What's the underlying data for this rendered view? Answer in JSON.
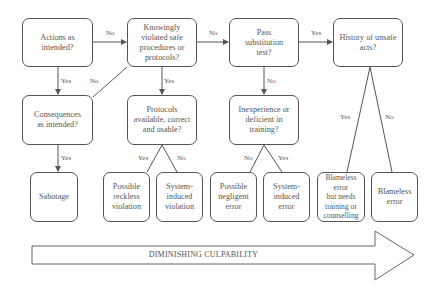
{
  "diagram": {
    "nodes": {
      "actions": "Actions as\nintended?",
      "knowingly": "Knowingly\nviolated safe\nprocedures or\nprotocols?",
      "substitution": "Pass\nsubstitution\ntest?",
      "history": "History of unsafe\nacts?",
      "consequences": "Consequences\nas intended?",
      "protocols": "Protocols\navailable, correct\nand usable?",
      "inexperience": "Inexperience or\ndeficient in\ntraining?",
      "sabotage": "Sabotage",
      "reckless": "Possible\nreckless\nviolation",
      "system_violation": "System-\ninduced\nviolation",
      "negligent": "Possible\nnegligent\nerror",
      "system_error": "System-\ninduced\nerror",
      "blameless_training": "Blameless\nerror\nbut needs\ntraining or\ncounselling",
      "blameless": "Blameless\nerror"
    },
    "edge_labels": {
      "actions_knowingly": "No",
      "actions_consequences": "Yes",
      "consequences_knowingly": "No",
      "knowingly_substitution": "No",
      "knowingly_protocols": "Yes",
      "substitution_history": "Yes",
      "substitution_inexperience": "No",
      "consequences_sabotage": "Yes",
      "protocols_reckless": "Yes",
      "protocols_system": "No",
      "inexperience_negligent": "No",
      "inexperience_system": "Yes",
      "history_yes": "Yes",
      "history_no": "No"
    },
    "arrow_label": "DIMINISHING CULPABILITY"
  }
}
